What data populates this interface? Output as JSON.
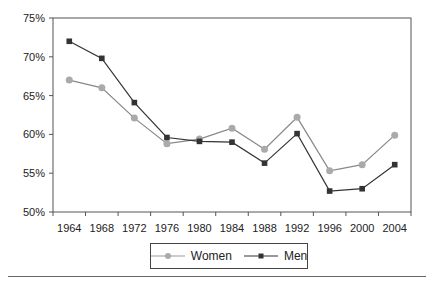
{
  "chart_data": {
    "type": "line",
    "title": "",
    "xlabel": "",
    "ylabel": "",
    "categories": [
      "1964",
      "1968",
      "1972",
      "1976",
      "1980",
      "1984",
      "1988",
      "1992",
      "1996",
      "2000",
      "2004"
    ],
    "series": [
      {
        "name": "Women",
        "color": "#aaaaaa",
        "marker": "circle",
        "values": [
          67.0,
          66.0,
          62.1,
          58.8,
          59.4,
          60.8,
          58.1,
          62.2,
          55.3,
          56.1,
          59.9
        ]
      },
      {
        "name": "Men",
        "color": "#333333",
        "marker": "square",
        "values": [
          72.0,
          69.8,
          64.1,
          59.6,
          59.1,
          59.0,
          56.3,
          60.1,
          52.7,
          53.0,
          56.1
        ]
      }
    ],
    "ylim": [
      50,
      75
    ],
    "yticks": [
      "50%",
      "55%",
      "60%",
      "65%",
      "70%",
      "75%"
    ],
    "grid": false,
    "legend_position": "bottom"
  },
  "legend": {
    "women_label": "Women",
    "men_label": "Men"
  }
}
